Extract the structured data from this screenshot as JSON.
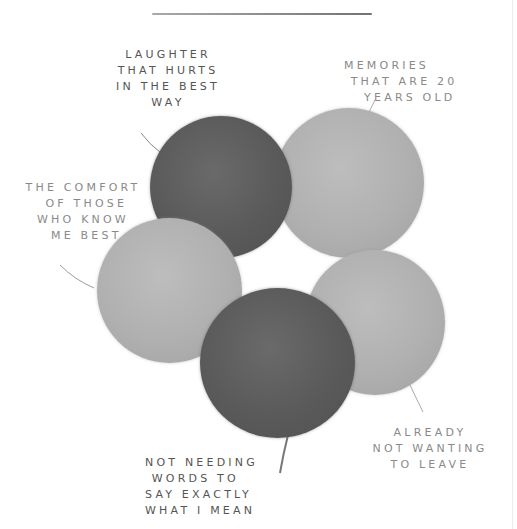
{
  "diagram": {
    "type": "circle-cluster-illustration",
    "circles": [
      {
        "id": "laughter",
        "tone": "dark",
        "color": "#5e5e5e"
      },
      {
        "id": "memories",
        "tone": "light",
        "color": "#b2b2b2"
      },
      {
        "id": "comfort",
        "tone": "light",
        "color": "#b2b2b2"
      },
      {
        "id": "leave",
        "tone": "light",
        "color": "#b2b2b2"
      },
      {
        "id": "words",
        "tone": "dark",
        "color": "#5a5a5a"
      }
    ],
    "labels": {
      "laughter": "LAUGHTER\nTHAT HURTS\nIN THE BEST\nWAY",
      "memories": "MEMORIES\n THAT ARE 20\n   YEARS OLD",
      "comfort": "THE COMFORT\n OF THOSE\nWHO KNOW\n ME BEST",
      "leave": "ALREADY\nNOT WANTING\nTO LEAVE",
      "words": "NOT NEEDING\n WORDS TO\nSAY EXACTLY\nWHAT I MEAN"
    }
  }
}
